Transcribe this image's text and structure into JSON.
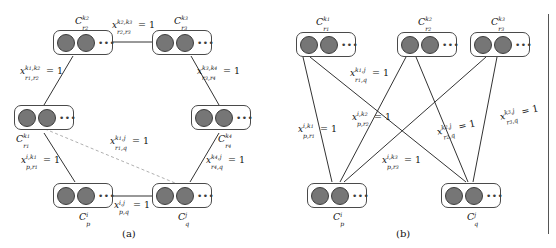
{
  "figure": {
    "panels": [
      {
        "id": "a",
        "caption": "(a)",
        "nodes": [
          {
            "name": "node-c-k2-r2",
            "base": "C",
            "sup": "k",
            "sup_n": "2",
            "sub": "r",
            "sub_n": "2"
          },
          {
            "name": "node-c-k3-r3",
            "base": "C",
            "sup": "k",
            "sup_n": "3",
            "sub": "r",
            "sub_n": "3"
          },
          {
            "name": "node-c-k1-r1",
            "base": "C",
            "sup": "k",
            "sup_n": "1",
            "sub": "r",
            "sub_n": "1"
          },
          {
            "name": "node-c-k4-r4",
            "base": "C",
            "sup": "k",
            "sup_n": "4",
            "sub": "r",
            "sub_n": "4"
          },
          {
            "name": "node-c-i-p",
            "base": "C",
            "sup": "i",
            "sup_n": "",
            "sub": "p",
            "sub_n": ""
          },
          {
            "name": "node-c-j-q",
            "base": "C",
            "sup": "j",
            "sup_n": "",
            "sub": "q",
            "sub_n": ""
          }
        ],
        "edge_labels": [
          {
            "name": "edge-label-k2r2-k3r3",
            "base": "x",
            "sup1": "k",
            "sup1_n": "2",
            "sup2": "k",
            "sup2_n": "3",
            "sub1": "r",
            "sub1_n": "2",
            "sub2": "r",
            "sub2_n": "3",
            "value": "= 1"
          },
          {
            "name": "edge-label-k1r1-k2r2",
            "base": "x",
            "sup1": "k",
            "sup1_n": "1",
            "sup2": "k",
            "sup2_n": "2",
            "sub1": "r",
            "sub1_n": "1",
            "sub2": "r",
            "sub2_n": "2",
            "value": "= 1"
          },
          {
            "name": "edge-label-k3r3-k4r4",
            "base": "x",
            "sup1": "k",
            "sup1_n": "3",
            "sup2": "k",
            "sup2_n": "4",
            "sub1": "r",
            "sub1_n": "3",
            "sub2": "r",
            "sub2_n": "4",
            "value": "= 1"
          },
          {
            "name": "edge-label-k1r1-jq",
            "base": "x",
            "sup1": "k",
            "sup1_n": "1",
            "sup2": "j",
            "sup2_n": "",
            "sub1": "r",
            "sub1_n": "1",
            "sub2": "q",
            "sub2_n": "",
            "value": "= 1"
          },
          {
            "name": "edge-label-ip-k1r1",
            "base": "x",
            "sup1": "i",
            "sup1_n": "",
            "sup2": "k",
            "sup2_n": "1",
            "sub1": "p",
            "sub1_n": "",
            "sub2": "r",
            "sub2_n": "1",
            "value": "= 1"
          },
          {
            "name": "edge-label-k4r4-jq",
            "base": "x",
            "sup1": "k",
            "sup1_n": "4",
            "sup2": "j",
            "sup2_n": "",
            "sub1": "r",
            "sub1_n": "4",
            "sub2": "q",
            "sub2_n": "",
            "value": "= 1"
          },
          {
            "name": "edge-label-ip-jq",
            "base": "x",
            "sup1": "i",
            "sup1_n": "",
            "sup2": "j",
            "sup2_n": "",
            "sub1": "p",
            "sub1_n": "",
            "sub2": "q",
            "sub2_n": "",
            "value": "= 1"
          }
        ]
      },
      {
        "id": "b",
        "caption": "(b)",
        "nodes": [
          {
            "name": "node-c-k1-r1",
            "base": "C",
            "sup": "k",
            "sup_n": "1",
            "sub": "r",
            "sub_n": "1"
          },
          {
            "name": "node-c-k2-r2",
            "base": "C",
            "sup": "k",
            "sup_n": "2",
            "sub": "r",
            "sub_n": "2"
          },
          {
            "name": "node-c-k3-r3",
            "base": "C",
            "sup": "k",
            "sup_n": "3",
            "sub": "r",
            "sub_n": "3"
          },
          {
            "name": "node-c-i-p",
            "base": "C",
            "sup": "i",
            "sup_n": "",
            "sub": "p",
            "sub_n": ""
          },
          {
            "name": "node-c-j-q",
            "base": "C",
            "sup": "j",
            "sup_n": "",
            "sub": "q",
            "sub_n": ""
          }
        ],
        "edge_labels": [
          {
            "name": "edge-label-k1r1-jq",
            "base": "x",
            "sup1": "k",
            "sup1_n": "1",
            "sup2": "j",
            "sup2_n": "",
            "sub1": "r",
            "sub1_n": "1",
            "sub2": "q",
            "sub2_n": "",
            "value": "= 1"
          },
          {
            "name": "edge-label-ip-k1r1",
            "base": "x",
            "sup1": "i",
            "sup1_n": "",
            "sup2": "k",
            "sup2_n": "1",
            "sub1": "p",
            "sub1_n": "",
            "sub2": "r",
            "sub2_n": "1",
            "value": "= 1"
          },
          {
            "name": "edge-label-ip-k2r2",
            "base": "x",
            "sup1": "i",
            "sup1_n": "",
            "sup2": "k",
            "sup2_n": "2",
            "sub1": "p",
            "sub1_n": "",
            "sub2": "r",
            "sub2_n": "2",
            "value": "= 1"
          },
          {
            "name": "edge-label-ip-k3r3",
            "base": "x",
            "sup1": "i",
            "sup1_n": "",
            "sup2": "k",
            "sup2_n": "3",
            "sub1": "p",
            "sub1_n": "",
            "sub2": "r",
            "sub2_n": "3",
            "value": "= 1"
          },
          {
            "name": "edge-label-k2r2-jq",
            "base": "x",
            "sup1": "k",
            "sup1_n": "2",
            "sup2": "j",
            "sup2_n": "",
            "sub1": "r",
            "sub1_n": "2",
            "sub2": "q",
            "sub2_n": "",
            "value": "= 1"
          },
          {
            "name": "edge-label-k3r3-jq",
            "base": "x",
            "sup1": "k",
            "sup1_n": "3",
            "sup2": "j",
            "sup2_n": "",
            "sub1": "r",
            "sub1_n": "3",
            "sub2": "q",
            "sub2_n": "",
            "value": "= 1"
          }
        ]
      }
    ],
    "colors": {
      "dot_fill": "#767676",
      "dot_stroke": "#3d3d3d",
      "box_stroke": "#4a4a4a",
      "edge_stroke": "#333333",
      "dashed_edge_stroke": "#b0b0b0",
      "text": "#111111"
    },
    "node_ellipsis": "•••"
  }
}
